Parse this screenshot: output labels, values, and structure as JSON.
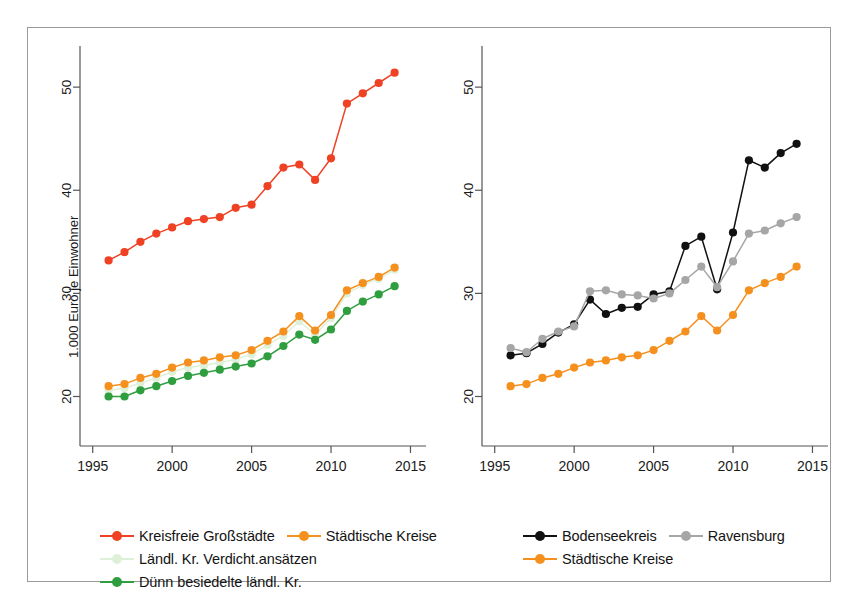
{
  "figure": {
    "title_fragment": "",
    "border_color": "#9a9a9a",
    "background": "#ffffff"
  },
  "colors": {
    "kreisfreie_grossstaedte": "#ef4123",
    "staedtische_kreise": "#f5901e",
    "laendl_verdicht": "#dff0d8",
    "duenn_besiedelt": "#2e9e3e",
    "bodenseekreis": "#111111",
    "ravensburg": "#a6a6a6",
    "axis": "#555555",
    "text": "#1b1b1b"
  },
  "panels": [
    {
      "id": "left",
      "ylabel": "1.000 Euro je Einwohner",
      "xlabel": "",
      "yticks": [
        20,
        30,
        40,
        50
      ],
      "xticks": [
        1995,
        2000,
        2005,
        2010,
        2015
      ],
      "legend": [
        [
          {
            "label": "Kreisfreie Großstädte",
            "color_key": "kreisfreie_grossstaedte",
            "name": "legend-kreisfreie-grossstaedte"
          },
          {
            "label": "Städtische Kreise",
            "color_key": "staedtische_kreise",
            "name": "legend-staedtische-kreise"
          }
        ],
        [
          {
            "label": "Ländl. Kr. Verdicht.ansätzen",
            "color_key": "laendl_verdicht",
            "name": "legend-laendl-kr-verdichtansaetzen"
          }
        ],
        [
          {
            "label": "Dünn besiedelte ländl. Kr.",
            "color_key": "duenn_besiedelt",
            "name": "legend-duenn-besiedelte-laendl-kr"
          }
        ]
      ]
    },
    {
      "id": "right",
      "ylabel": "1.000 Euro je Einwohner",
      "xlabel": "",
      "yticks": [
        20,
        30,
        40,
        50
      ],
      "xticks": [
        1995,
        2000,
        2005,
        2010,
        2015
      ],
      "legend": [
        [
          {
            "label": "Bodenseekreis",
            "color_key": "bodenseekreis",
            "name": "legend-bodenseekreis"
          },
          {
            "label": "Ravensburg",
            "color_key": "ravensburg",
            "name": "legend-ravensburg"
          }
        ],
        [
          {
            "label": "Städtische Kreise",
            "color_key": "staedtische_kreise",
            "name": "legend-staedtische-kreise-right"
          }
        ]
      ]
    }
  ],
  "chart_data": [
    {
      "type": "line",
      "panel": "left",
      "title": "",
      "xlabel": "",
      "ylabel": "1.000 Euro je Einwohner",
      "xlim": [
        1994.2,
        2015.6
      ],
      "ylim": [
        15.2,
        53.6
      ],
      "xticks": [
        1995,
        2000,
        2005,
        2010,
        2015
      ],
      "yticks": [
        20,
        30,
        40,
        50
      ],
      "grid": false,
      "legend_position": "below",
      "x": [
        1996,
        1997,
        1998,
        1999,
        2000,
        2001,
        2002,
        2003,
        2004,
        2005,
        2006,
        2007,
        2008,
        2009,
        2010,
        2011,
        2012,
        2013
      ],
      "series": [
        {
          "name": "Kreisfreie Großstädte",
          "color": "#ef4123",
          "values": [
            33.2,
            34.0,
            35.0,
            35.8,
            36.4,
            37.0,
            37.2,
            37.4,
            38.3,
            38.6,
            40.4,
            42.2,
            42.5,
            41.0,
            43.1,
            48.4,
            49.4,
            50.4,
            51.4
          ]
        },
        {
          "name": "Städtische Kreise",
          "color": "#f5901e",
          "values": [
            21.0,
            21.2,
            21.8,
            22.2,
            22.8,
            23.3,
            23.5,
            23.8,
            24.0,
            24.5,
            25.4,
            26.3,
            27.8,
            26.4,
            27.9,
            30.3,
            31.0,
            31.6,
            32.5
          ]
        },
        {
          "name": "Ländl. Kr. Verdicht.ansätzen",
          "color": "#dff0d8",
          "values": [
            20.6,
            20.8,
            21.3,
            21.8,
            22.4,
            22.8,
            23.0,
            23.3,
            23.6,
            24.1,
            25.0,
            25.9,
            27.3,
            26.0,
            27.6,
            30.0,
            30.8,
            31.4,
            32.3
          ]
        },
        {
          "name": "Dünn besiedelte ländl. Kr.",
          "color": "#2e9e3e",
          "values": [
            20.0,
            20.0,
            20.6,
            21.0,
            21.5,
            22.0,
            22.3,
            22.6,
            22.9,
            23.2,
            23.9,
            24.9,
            26.0,
            25.5,
            26.5,
            28.3,
            29.2,
            29.9,
            30.7
          ]
        }
      ]
    },
    {
      "type": "line",
      "panel": "right",
      "title": "",
      "xlabel": "",
      "ylabel": "1.000 Euro je Einwohner",
      "xlim": [
        1994.2,
        2015.6
      ],
      "ylim": [
        15.2,
        53.6
      ],
      "xticks": [
        1995,
        2000,
        2005,
        2010,
        2015
      ],
      "yticks": [
        20,
        30,
        40,
        50
      ],
      "grid": false,
      "legend_position": "below",
      "x": [
        1996,
        1997,
        1998,
        1999,
        2000,
        2001,
        2002,
        2003,
        2004,
        2005,
        2006,
        2007,
        2008,
        2009,
        2010,
        2011,
        2012,
        2013
      ],
      "series": [
        {
          "name": "Bodenseekreis",
          "color": "#111111",
          "values": [
            24.0,
            24.2,
            25.1,
            26.2,
            27.0,
            29.4,
            28.0,
            28.6,
            28.7,
            29.9,
            30.2,
            34.6,
            35.5,
            30.4,
            35.9,
            42.9,
            42.2,
            43.6,
            44.5
          ]
        },
        {
          "name": "Ravensburg",
          "color": "#a6a6a6",
          "values": [
            24.7,
            24.3,
            25.6,
            26.3,
            26.8,
            30.2,
            30.3,
            29.9,
            29.8,
            29.5,
            30.0,
            31.3,
            32.6,
            30.6,
            33.1,
            35.8,
            36.1,
            36.8,
            37.4
          ]
        },
        {
          "name": "Städtische Kreise",
          "color": "#f5901e",
          "values": [
            21.0,
            21.2,
            21.8,
            22.2,
            22.8,
            23.3,
            23.5,
            23.8,
            24.0,
            24.5,
            25.4,
            26.3,
            27.8,
            26.4,
            27.9,
            30.3,
            31.0,
            31.6,
            32.6
          ]
        }
      ]
    }
  ]
}
